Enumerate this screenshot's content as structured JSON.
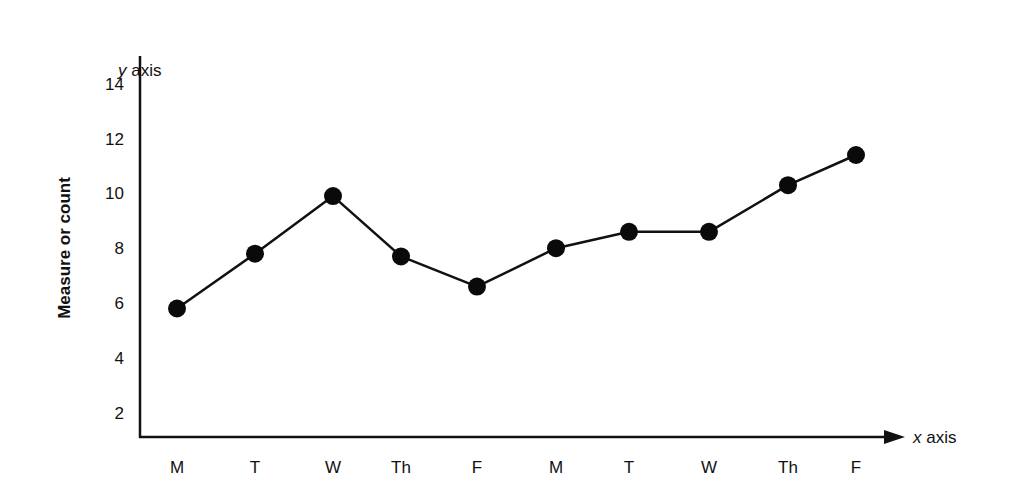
{
  "chart_data": {
    "type": "line",
    "title": "",
    "ylabel": "Measure or count",
    "xlabel": "",
    "y_axis_title": "y axis",
    "x_axis_title": "x axis",
    "categories": [
      "M",
      "T",
      "W",
      "Th",
      "F",
      "M",
      "T",
      "W",
      "Th",
      "F"
    ],
    "series": [
      {
        "name": "Measure or count",
        "values": [
          5.8,
          7.8,
          9.9,
          7.7,
          6.6,
          8.0,
          8.6,
          8.6,
          10.3,
          11.4
        ],
        "color": "#111111",
        "marker": "filled-circle"
      }
    ],
    "yticks": [
      2,
      4,
      6,
      8,
      10,
      12,
      14
    ],
    "ylim": [
      1,
      15
    ],
    "grid": false,
    "legend": "none",
    "x_axis_arrow": true
  }
}
